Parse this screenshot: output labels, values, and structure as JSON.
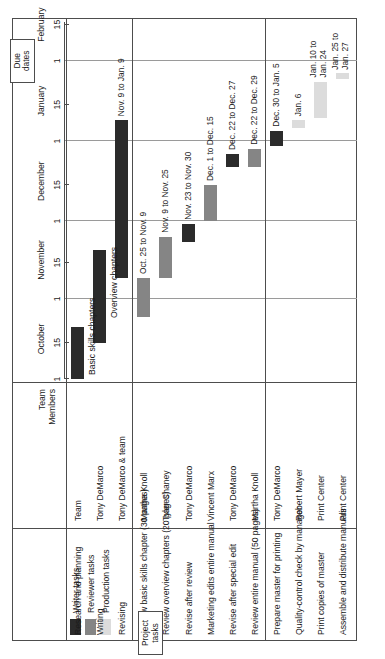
{
  "title": "Writing/Review Schedule: Software User's Manual",
  "columns": {
    "task_header": "",
    "members_header_line1": "Team",
    "members_header_line2": "Members"
  },
  "legend": {
    "items": [
      {
        "label": "Writer tasks",
        "color": "#2b2b2b"
      },
      {
        "label": "Reviewer tasks",
        "color": "#858585"
      },
      {
        "label": "Production tasks",
        "color": "#dcdcdc"
      }
    ]
  },
  "callouts": {
    "due_dates": "Due\ndates",
    "due_dates_line1": "Due",
    "due_dates_line2": "dates",
    "project_tasks_line1": "Project",
    "project_tasks_line2": "tasks"
  },
  "annotations": {
    "basic_skills_chapters": "Basic skills chapters",
    "overview_chapters": "Overview chapters"
  },
  "chart_data": {
    "type": "bar",
    "chart_subtype": "gantt",
    "title": "Writing/Review Schedule: Software User's Manual",
    "xlabel": "",
    "ylabel": "",
    "grid": true,
    "legend_position": "top-left",
    "axis": {
      "months": [
        "October",
        "November",
        "December",
        "January",
        "February"
      ],
      "ticks": [
        "1",
        "15",
        "1",
        "15",
        "1",
        "15",
        "1",
        "15",
        "1",
        "15"
      ],
      "x_start": "October 1",
      "x_end": "February 15"
    },
    "groups": [
      {
        "name": "Writer tasks",
        "color": "#2b2b2b",
        "rows": [
          0,
          1,
          2
        ]
      },
      {
        "name": "Reviewer tasks",
        "color": "#858585",
        "rows": [
          3,
          4,
          5,
          6,
          7,
          8
        ]
      },
      {
        "name": "Production tasks",
        "color": "#dcdcdc",
        "rows": [
          9,
          10,
          11,
          12
        ]
      }
    ],
    "categories": [
      "Research and planning",
      "Writing",
      "Revising",
      "Review basic skills chapter (30 pages)",
      "Review overview chapters (20 pages)",
      "Revise after review",
      "Marketing edits entire manual",
      "Revise after special edit",
      "Review entire manual (50 pages)",
      "Prepare master for printing",
      "Quality-control check by manager",
      "Print copies of master",
      "Assemble and distribute manuals"
    ],
    "tasks": [
      {
        "task": "Research and planning",
        "members": "Team",
        "group": "Writer tasks",
        "color": "#2b2b2b",
        "bar_label": "",
        "start": "Oct. 1",
        "end": "Oct. 21",
        "start_day": 0,
        "end_day": 20
      },
      {
        "task": "Writing",
        "members": "Tony DeMarco",
        "group": "Writer tasks",
        "color": "#2b2b2b",
        "bar_label": "",
        "start": "Oct. 15",
        "end": "Nov. 20",
        "start_day": 14,
        "end_day": 50
      },
      {
        "task": "Revising",
        "members": "Tony DeMarco & team",
        "group": "Writer tasks",
        "color": "#2b2b2b",
        "bar_label": "Nov. 9 to Jan. 9",
        "start": "Nov. 9",
        "end": "Jan. 9",
        "start_day": 39,
        "end_day": 100
      },
      {
        "task": "Review basic skills chapter (30 pages)",
        "members": "Martha Knoll",
        "group": "Reviewer tasks",
        "color": "#858585",
        "bar_label": "Oct. 25 to Nov. 9",
        "start": "Oct. 25",
        "end": "Nov. 9",
        "start_day": 24,
        "end_day": 39
      },
      {
        "task": "Review overview chapters (20 pages)",
        "members": "Tyler Chaney",
        "group": "Reviewer tasks",
        "color": "#858585",
        "bar_label": "Nov. 9 to Nov. 25",
        "start": "Nov. 9",
        "end": "Nov. 25",
        "start_day": 39,
        "end_day": 55
      },
      {
        "task": "Revise after review",
        "members": "Tony DeMarco",
        "group": "Writer tasks",
        "color": "#2b2b2b",
        "bar_label": "Nov. 23 to Nov. 30",
        "start": "Nov. 23",
        "end": "Nov. 30",
        "start_day": 53,
        "end_day": 60
      },
      {
        "task": "Marketing edits entire manual",
        "members": "Vincent Marx",
        "group": "Reviewer tasks",
        "color": "#858585",
        "bar_label": "Dec. 1 to Dec. 15",
        "start": "Dec. 1",
        "end": "Dec. 15",
        "start_day": 61,
        "end_day": 75
      },
      {
        "task": "Revise after special edit",
        "members": "Tony DeMarco",
        "group": "Writer tasks",
        "color": "#2b2b2b",
        "bar_label": "Dec. 22 to Dec. 27",
        "start": "Dec. 22",
        "end": "Dec. 27",
        "start_day": 82,
        "end_day": 87
      },
      {
        "task": "Review entire manual (50 pages)",
        "members": "Martha Knoll",
        "group": "Reviewer tasks",
        "color": "#858585",
        "bar_label": "Dec. 22 to Dec. 29",
        "start": "Dec. 22",
        "end": "Dec. 29",
        "start_day": 82,
        "end_day": 89
      },
      {
        "task": "Prepare master for printing",
        "members": "Tony DeMarco",
        "group": "Writer tasks",
        "color": "#2b2b2b",
        "bar_label": "Dec. 30 to Jan. 5",
        "start": "Dec. 30",
        "end": "Jan. 5",
        "start_day": 90,
        "end_day": 96
      },
      {
        "task": "Quality-control check by manager",
        "members": "Robert Mayer",
        "group": "Production tasks",
        "color": "#dcdcdc",
        "bar_label": "Jan. 6",
        "start": "Jan. 6",
        "end": "Jan. 9",
        "start_day": 97,
        "end_day": 100
      },
      {
        "task": "Print copies of master",
        "members": "Print Center",
        "group": "Production tasks",
        "color": "#dcdcdc",
        "bar_label": "Jan. 10 to Jan. 24",
        "bar_label_line1": "Jan. 10 to",
        "bar_label_line2": "Jan. 24",
        "start": "Jan. 10",
        "end": "Jan. 24",
        "start_day": 101,
        "end_day": 115
      },
      {
        "task": "Assemble and distribute manuals",
        "members": "Print Center",
        "group": "Production tasks",
        "color": "#dcdcdc",
        "bar_label": "Jan. 25 to Jan. 27",
        "bar_label_line1": "Jan. 25 to",
        "bar_label_line2": "Jan. 27",
        "start": "Jan. 25",
        "end": "Jan. 27",
        "start_day": 116,
        "end_day": 118
      }
    ]
  }
}
